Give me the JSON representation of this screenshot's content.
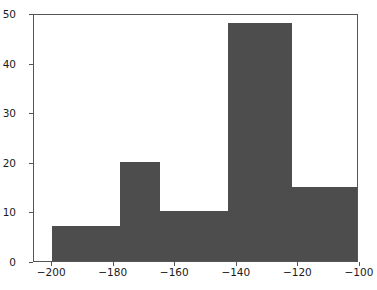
{
  "chart_data": {
    "type": "bar",
    "subtype": "histogram",
    "title": "",
    "xlabel": "",
    "ylabel": "",
    "xlim": [
      -205.9,
      -100.3
    ],
    "ylim": [
      0,
      50
    ],
    "grid": false,
    "legend": null,
    "bar_color": "#4d4d4d",
    "bin_edges": [
      -200,
      -178,
      -165,
      -143,
      -122,
      -94
    ],
    "values": [
      7,
      20,
      10,
      48,
      15
    ],
    "categories": [
      "-200 to -178",
      "-178 to -165",
      "-165 to -143",
      "-143 to -122",
      "-122 to -94"
    ],
    "xticks": [
      -200,
      -180,
      -160,
      -140,
      -120,
      -100
    ],
    "xtick_labels": [
      "−200",
      "−180",
      "−160",
      "−140",
      "−120",
      "−100"
    ],
    "yticks": [
      0,
      10,
      20,
      30,
      40,
      50
    ],
    "ytick_labels": [
      "0",
      "10",
      "20",
      "30",
      "40",
      "50"
    ]
  },
  "figure": {
    "background": "#ffffff",
    "axes_edge_color": "#555555"
  }
}
